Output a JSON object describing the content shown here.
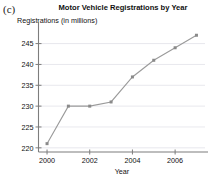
{
  "figure": {
    "panel_label": "(c)"
  },
  "axis": {
    "x_label": "Year",
    "y_label": "Registrations (in millions)",
    "y_ticks": [
      "220",
      "225",
      "230",
      "235",
      "240",
      "245"
    ],
    "x_ticks": [
      "2000",
      "2002",
      "2004",
      "2006"
    ]
  },
  "style": {
    "line_color": "#9a9a9a",
    "marker_color": "#8a8a8a",
    "grid_color": "#e2e2e8",
    "axis_color": "#7d7d7d",
    "text_color": "#111111"
  },
  "chart_data": {
    "type": "line",
    "title": "Motor Vehicle Registrations by Year",
    "xlabel": "Year",
    "ylabel": "Registrations (in millions)",
    "x": [
      2000,
      2001,
      2002,
      2003,
      2004,
      2005,
      2006,
      2007
    ],
    "values": [
      221,
      230,
      230,
      231,
      237,
      241,
      244,
      247
    ],
    "xlim": [
      1999.6,
      2007.4
    ],
    "ylim": [
      219,
      248.5
    ],
    "x_ticks": [
      2000,
      2002,
      2004,
      2006
    ],
    "y_ticks": [
      220,
      225,
      230,
      235,
      240,
      245
    ],
    "grid": "horizontal",
    "legend": "none",
    "series": [
      {
        "name": "Motor Vehicle Registrations",
        "values": [
          221,
          230,
          230,
          231,
          237,
          241,
          244,
          247
        ]
      }
    ]
  }
}
